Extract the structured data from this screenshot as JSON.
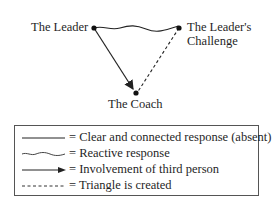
{
  "diagram": {
    "nodes": [
      {
        "id": "leader",
        "label": "The Leader"
      },
      {
        "id": "challenge",
        "label_line1": "The Leader's",
        "label_line2": "Challenge"
      },
      {
        "id": "coach",
        "label": "The Coach"
      }
    ],
    "edges": [
      {
        "from": "leader",
        "to": "challenge",
        "style": "wavy",
        "meaning": "Reactive response"
      },
      {
        "from": "leader",
        "to": "coach",
        "style": "arrow",
        "meaning": "Involvement of third person"
      },
      {
        "from": "challenge",
        "to": "coach",
        "style": "dashed",
        "meaning": "Triangle is created"
      }
    ]
  },
  "legend": {
    "items": [
      {
        "symbol": "solid-line",
        "text": "= Clear and connected response (absent)"
      },
      {
        "symbol": "wavy-line",
        "text": "= Reactive response"
      },
      {
        "symbol": "arrow-line",
        "text": "= Involvement of third person"
      },
      {
        "symbol": "dashed-line",
        "text": "= Triangle is created"
      }
    ]
  },
  "colors": {
    "line": "#222222",
    "border": "#555555",
    "background": "#ffffff"
  }
}
